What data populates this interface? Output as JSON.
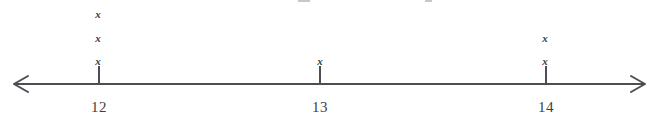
{
  "figure": {
    "type": "dotplot-number-line",
    "line_color": "#4e4e52",
    "marker_color": "#3b3b3f",
    "marker_glyph": "x",
    "axis": {
      "y_px": 84,
      "start_px": 14,
      "end_px": 645,
      "left_arrow": "left-arrowhead",
      "right_arrow": "right-arrowhead"
    },
    "ticks": [
      {
        "label": "12",
        "x_px": 99,
        "count": 3
      },
      {
        "label": "13",
        "x_px": 320,
        "count": 1
      },
      {
        "label": "14",
        "x_px": 546,
        "count": 2
      }
    ],
    "marks": [
      {
        "label": "12",
        "x_px": 98,
        "y_px": 9
      },
      {
        "label": "12",
        "x_px": 98,
        "y_px": 33
      },
      {
        "label": "12",
        "x_px": 98,
        "y_px": 56
      },
      {
        "label": "13",
        "x_px": 320,
        "y_px": 56
      },
      {
        "label": "14",
        "x_px": 545,
        "y_px": 33
      },
      {
        "label": "14",
        "x_px": 545,
        "y_px": 56
      }
    ],
    "residue": [
      {
        "x_px": 298,
        "width_px": 12
      },
      {
        "x_px": 425,
        "width_px": 7
      }
    ]
  },
  "chart_data": {
    "type": "dotplot",
    "title": "",
    "subtitle": "",
    "xlabel": "",
    "ylabel": "",
    "categories": [
      "12",
      "13",
      "14"
    ],
    "values": [
      3,
      1,
      2
    ],
    "marker": "x",
    "xlim": [
      11.6,
      14.4
    ],
    "ticks": [
      "12",
      "13",
      "14"
    ],
    "grid": false,
    "legend": null,
    "annotations": []
  }
}
